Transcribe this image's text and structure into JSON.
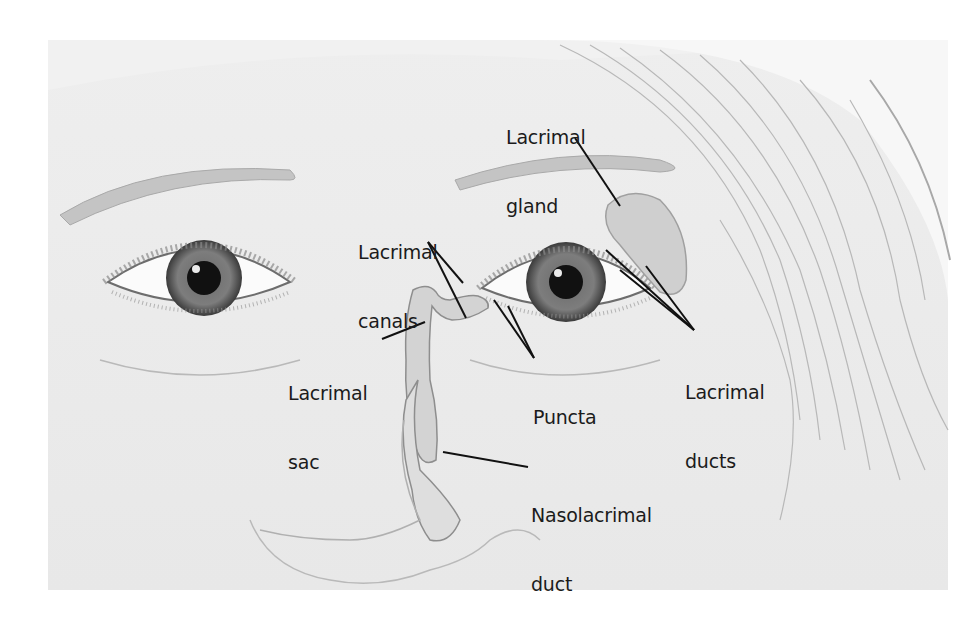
{
  "figure": {
    "background_color": "#f1f1f1",
    "label_color": "#1b1b1b",
    "leader_line_color": "#111111"
  },
  "labels": {
    "lacrimal_gland": {
      "line1": "Lacrimal",
      "line2": "gland"
    },
    "lacrimal_canals": {
      "line1": "Lacrimal",
      "line2": "canals"
    },
    "lacrimal_sac": {
      "line1": "Lacrimal",
      "line2": "sac"
    },
    "puncta": {
      "line1": "Puncta"
    },
    "lacrimal_ducts": {
      "line1": "Lacrimal",
      "line2": "ducts"
    },
    "nasolacrimal_duct": {
      "line1": "Nasolacrimal",
      "line2": "duct"
    }
  }
}
